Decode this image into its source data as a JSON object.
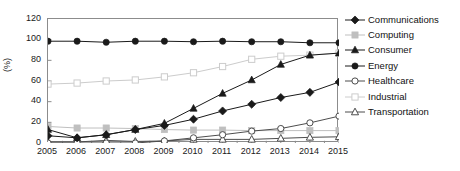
{
  "chart_data": {
    "type": "line",
    "title": "",
    "xlabel": "",
    "ylabel": "(%)",
    "categories": [
      "2005",
      "2006",
      "2007",
      "2008",
      "2009",
      "2010",
      "2011",
      "2012",
      "2013",
      "2014",
      "2015"
    ],
    "x": [
      2005,
      2006,
      2007,
      2008,
      2009,
      2010,
      2011,
      2012,
      2013,
      2014,
      2015
    ],
    "ylim": [
      0,
      120
    ],
    "yticks": [
      0,
      20,
      40,
      60,
      80,
      100,
      120
    ],
    "xlim": [
      2005,
      2015
    ],
    "grid": false,
    "legend_position": "right",
    "series": [
      {
        "name": "Communications",
        "marker": "filled-diamond",
        "color": "#1a1a1a",
        "values": [
          7,
          5,
          8,
          13,
          17,
          23,
          31,
          37.5,
          44,
          49,
          59
        ]
      },
      {
        "name": "Computing",
        "marker": "filled-square",
        "color": "#bfbfbf",
        "values": [
          16,
          14.5,
          14.5,
          14,
          13,
          12.5,
          12.5,
          12,
          12,
          12,
          12
        ]
      },
      {
        "name": "Consumer",
        "marker": "filled-triangle",
        "color": "#1a1a1a",
        "values": [
          13,
          5,
          8,
          13,
          19,
          33.5,
          48,
          61,
          76,
          85,
          87
        ]
      },
      {
        "name": "Energy",
        "marker": "filled-circle",
        "color": "#1a1a1a",
        "values": [
          98.5,
          98.5,
          97.5,
          98.5,
          98.5,
          98,
          98.5,
          98,
          98,
          97,
          97
        ]
      },
      {
        "name": "Healthcare",
        "marker": "open-circle",
        "color": "#4d4d4d",
        "values": [
          0,
          0,
          0,
          0,
          2,
          5,
          8,
          11.5,
          14,
          19.5,
          26
        ]
      },
      {
        "name": "Industrial",
        "marker": "open-square",
        "color": "#cccccc",
        "values": [
          57,
          58,
          60,
          61,
          64,
          68,
          74,
          81,
          84,
          85,
          87
        ]
      },
      {
        "name": "Transportation",
        "marker": "open-triangle",
        "color": "#4d4d4d",
        "values": [
          1,
          1,
          2.5,
          1.5,
          2,
          3.5,
          3.5,
          3.5,
          4.5,
          5.5,
          6
        ]
      }
    ]
  },
  "axes": {
    "y_title": "(%)",
    "y_ticks": [
      "120",
      "100",
      "80",
      "60",
      "40",
      "20",
      "0"
    ],
    "x_ticks": [
      "2005",
      "2006",
      "2007",
      "2008",
      "2009",
      "2010",
      "2011",
      "2012",
      "2013",
      "2014",
      "2015"
    ]
  },
  "legend": {
    "items": [
      {
        "label": "Communications",
        "marker": "filled-diamond",
        "color": "#1a1a1a"
      },
      {
        "label": "Computing",
        "marker": "filled-square",
        "color": "#bfbfbf"
      },
      {
        "label": "Consumer",
        "marker": "filled-triangle",
        "color": "#1a1a1a"
      },
      {
        "label": "Energy",
        "marker": "filled-circle",
        "color": "#1a1a1a"
      },
      {
        "label": "Healthcare",
        "marker": "open-circle",
        "color": "#4d4d4d"
      },
      {
        "label": "Industrial",
        "marker": "open-square",
        "color": "#cccccc"
      },
      {
        "label": "Transportation",
        "marker": "open-triangle",
        "color": "#4d4d4d"
      }
    ]
  }
}
